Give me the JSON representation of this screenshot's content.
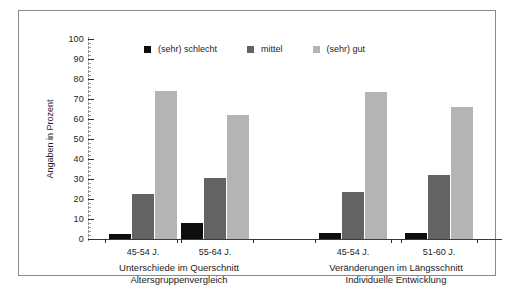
{
  "chart_data": {
    "type": "bar",
    "title": "",
    "xlabel": "",
    "ylabel": "Angaben in Prozent",
    "ylim": [
      0,
      100
    ],
    "ytick_step": 10,
    "yticks": [
      0,
      10,
      20,
      30,
      40,
      50,
      60,
      70,
      80,
      90,
      100
    ],
    "ytick_labels": [
      "0",
      "10",
      "20",
      "30",
      "40",
      "50",
      "60",
      "70",
      "80",
      "90",
      "100"
    ],
    "grid": false,
    "legend_position": "top-center",
    "categories": [
      "45-54 J.",
      "55-64 J.",
      "45-54 J.",
      "51-60 J."
    ],
    "series": [
      {
        "name": "(sehr) schlecht",
        "color": "#0d0d0d",
        "values": [
          2.5,
          8,
          3,
          3
        ]
      },
      {
        "name": "mittel",
        "color": "#636363",
        "values": [
          22.5,
          30.5,
          23.5,
          32
        ]
      },
      {
        "name": "(sehr) gut",
        "color": "#b4b4b4",
        "values": [
          74,
          62,
          73.5,
          66
        ]
      }
    ],
    "panels": [
      {
        "caption_line1": "Unterschiede im Querschnitt",
        "caption_line2": "Altersgruppenvergleich"
      },
      {
        "caption_line1": "Veränderungen im Längsschnitt",
        "caption_line2": "Individuelle Entwicklung"
      }
    ]
  },
  "legend": {
    "items": [
      {
        "label": "(sehr) schlecht"
      },
      {
        "label": "mittel"
      },
      {
        "label": "(sehr) gut"
      }
    ]
  },
  "axis": {
    "y_title": "Angaben in Prozent",
    "y_labels": [
      "100",
      "90",
      "80",
      "70",
      "60",
      "50",
      "40",
      "30",
      "20",
      "10",
      "0"
    ]
  },
  "categories": [
    {
      "label": "45-54 J."
    },
    {
      "label": "55-64 J."
    },
    {
      "label": "45-54 J."
    },
    {
      "label": "51-60 J."
    }
  ],
  "panels": [
    {
      "line1": "Unterschiede im Querschnitt",
      "line2": "Altersgruppenvergleich"
    },
    {
      "line1": "Veränderungen im Längsschnitt",
      "line2": "Individuelle Entwicklung"
    }
  ]
}
